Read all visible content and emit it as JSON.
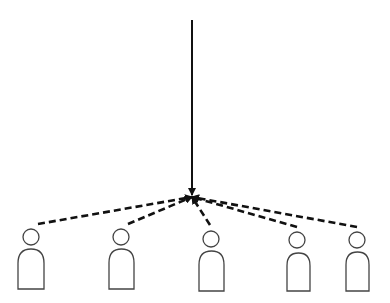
{
  "diagram": {
    "type": "many-to-one convergence",
    "colors": {
      "line": "#111111",
      "figure_outline": "#444444",
      "background": "#ffffff"
    },
    "convergence_point": {
      "x": 192,
      "y": 197
    },
    "main_arrow": {
      "style": "solid",
      "from": {
        "x": 192,
        "y": 20
      },
      "to": {
        "x": 192,
        "y": 195
      }
    },
    "persons": [
      {
        "id": "person-1",
        "head": {
          "cx": 31,
          "cy": 237,
          "r": 8
        },
        "body": {
          "x": 18,
          "top": 249,
          "w": 26,
          "bottom": 289
        },
        "arrow_start": {
          "x": 38,
          "y": 224
        }
      },
      {
        "id": "person-2",
        "head": {
          "cx": 121,
          "cy": 237,
          "r": 8
        },
        "body": {
          "x": 109,
          "top": 249,
          "w": 25,
          "bottom": 289
        },
        "arrow_start": {
          "x": 128,
          "y": 224
        }
      },
      {
        "id": "person-3",
        "head": {
          "cx": 211,
          "cy": 239,
          "r": 8
        },
        "body": {
          "x": 199,
          "top": 251,
          "w": 25,
          "bottom": 291
        },
        "arrow_start": {
          "x": 210,
          "y": 225
        }
      },
      {
        "id": "person-4",
        "head": {
          "cx": 297,
          "cy": 240,
          "r": 8
        },
        "body": {
          "x": 287,
          "top": 253,
          "w": 23,
          "bottom": 291
        },
        "arrow_start": {
          "x": 297,
          "y": 227
        }
      },
      {
        "id": "person-5",
        "head": {
          "cx": 357,
          "cy": 240,
          "r": 8
        },
        "body": {
          "x": 346,
          "top": 252,
          "w": 23,
          "bottom": 291
        },
        "arrow_start": {
          "x": 357,
          "y": 227
        }
      }
    ]
  }
}
